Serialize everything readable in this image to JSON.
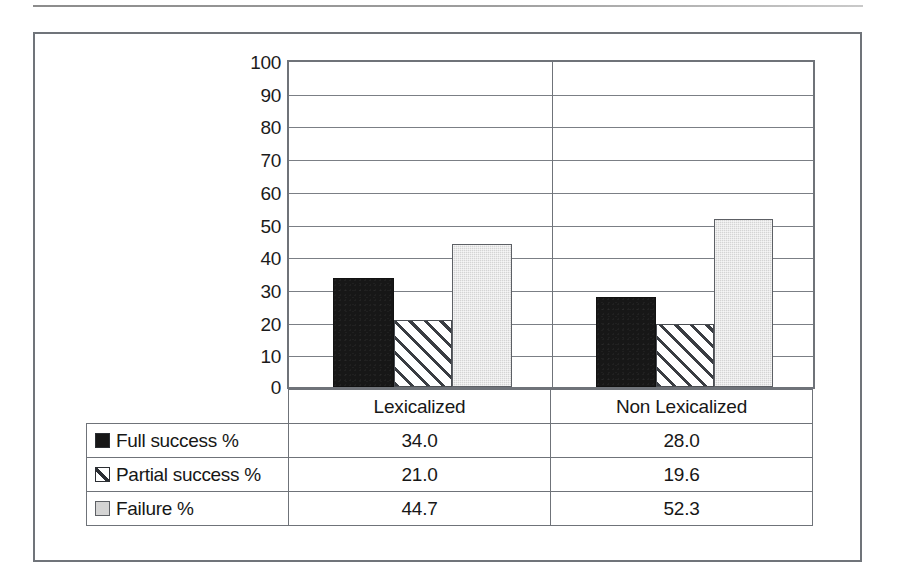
{
  "figure": {
    "categories": [
      "Lexicalized",
      "Non Lexicalized"
    ],
    "y_ticks": [
      "100",
      "90",
      "80",
      "70",
      "60",
      "50",
      "40",
      "30",
      "20",
      "10",
      "0"
    ]
  },
  "legend": [
    {
      "label": "Full success %",
      "swatch": "solid-black-square"
    },
    {
      "label": "Partial success %",
      "swatch": "diagonal-hatch-square"
    },
    {
      "label": "Failure %",
      "swatch": "light-gray-square"
    }
  ],
  "table": {
    "rows": [
      {
        "label": "Full success %",
        "values": [
          "34.0",
          "28.0"
        ]
      },
      {
        "label": "Partial success %",
        "values": [
          "21.0",
          "19.6"
        ]
      },
      {
        "label": "Failure %",
        "values": [
          "44.7",
          "52.3"
        ]
      }
    ]
  },
  "colors": {
    "full_success": "#171717",
    "partial_success": "#ffffff",
    "failure": "#d4d4d4",
    "frame": "#70747a",
    "gridline": "#7b7f85"
  },
  "chart_data": {
    "type": "bar",
    "title": "",
    "xlabel": "",
    "ylabel": "",
    "ylim": [
      0,
      100
    ],
    "ytick_step": 10,
    "grid": true,
    "legend_position": "data-table-left-column",
    "categories": [
      "Lexicalized",
      "Non Lexicalized"
    ],
    "series": [
      {
        "name": "Full success %",
        "values": [
          34.0,
          28.0
        ]
      },
      {
        "name": "Partial success %",
        "values": [
          21.0,
          19.6
        ]
      },
      {
        "name": "Failure %",
        "values": [
          44.7,
          52.3
        ]
      }
    ]
  }
}
